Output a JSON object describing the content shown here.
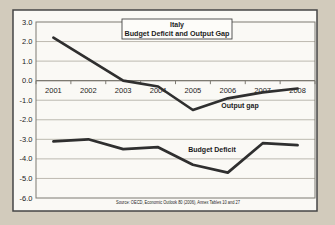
{
  "page": {
    "background_color": "#d2cbbc",
    "frame_fill": "#faf9f5",
    "frame_border_color": "#454545"
  },
  "chart_data": {
    "type": "line",
    "title": "Italy",
    "subtitle": "Budget Deficit and Output Gap",
    "categories": [
      "2001",
      "2002",
      "2003",
      "2004",
      "2005",
      "2006",
      "2007",
      "2008"
    ],
    "series": [
      {
        "name": "Output gap",
        "values": [
          2.2,
          1.1,
          0.0,
          -0.3,
          -1.5,
          -0.9,
          -0.6,
          -0.4
        ]
      },
      {
        "name": "Budget Deficit",
        "values": [
          -3.1,
          -3.0,
          -3.5,
          -3.4,
          -4.3,
          -4.7,
          -3.2,
          -3.3
        ]
      }
    ],
    "ylim": [
      -6.0,
      3.0
    ],
    "ytick_step": 1.0,
    "ytick_labels": [
      "3.0",
      "2.0",
      "1.0",
      "0.0",
      "-1.0",
      "-2.0",
      "-3.0",
      "-4.0",
      "-5.0",
      "-6.0"
    ],
    "grid": true,
    "legend_position": "inline-labels",
    "source_note": "Source: OECD, Economic Outlook 80 (2006), Annex Tables 10 and 27",
    "line_color": "#2f2f2f",
    "grid_color": "#b6b2a8",
    "axis_color": "#7d7a72"
  }
}
